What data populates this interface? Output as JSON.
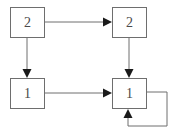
{
  "diagram": {
    "type": "directed-graph",
    "background_color": "#ffffff",
    "stroke_color": "#6e6e6e",
    "label_color": "#4a4a4a",
    "canvas": {
      "width": 178,
      "height": 133
    },
    "nodes": [
      {
        "id": "n-top-left",
        "label": "2",
        "x": 10,
        "y": 7,
        "width": 35,
        "height": 31
      },
      {
        "id": "n-top-right",
        "label": "2",
        "x": 112,
        "y": 7,
        "width": 35,
        "height": 31
      },
      {
        "id": "n-bottom-left",
        "label": "1",
        "x": 10,
        "y": 78,
        "width": 35,
        "height": 31
      },
      {
        "id": "n-bottom-right",
        "label": "1",
        "x": 112,
        "y": 78,
        "width": 35,
        "height": 31
      }
    ],
    "edges": [
      {
        "id": "edge-top-left-to-top-right",
        "from": "n-top-left",
        "to": "n-top-right",
        "direction": "right",
        "path": "M 45 22 L 107 22"
      },
      {
        "id": "edge-top-left-to-bottom-left",
        "from": "n-top-left",
        "to": "n-bottom-left",
        "direction": "down",
        "path": "M 27 38 L 27 73"
      },
      {
        "id": "edge-top-right-to-bottom-right",
        "from": "n-top-right",
        "to": "n-bottom-right",
        "direction": "down",
        "path": "M 129 38 L 129 73"
      },
      {
        "id": "edge-bottom-left-to-bottom-right",
        "from": "n-bottom-left",
        "to": "n-bottom-right",
        "direction": "right",
        "path": "M 45 93 L 107 93"
      },
      {
        "id": "edge-bottom-right-self-loop",
        "from": "n-bottom-right",
        "to": "n-bottom-right",
        "direction": "up",
        "path": "M 147 92 L 167 92 L 167 126 L 128 126 L 128 113"
      }
    ],
    "arrowheads": [
      {
        "id": "arrowhead-into-top-right",
        "edge": "edge-top-left-to-top-right",
        "tip_x": 112,
        "tip_y": 22,
        "points": "112,22 103,17.5 103,26.5"
      },
      {
        "id": "arrowhead-into-bottom-left",
        "edge": "edge-top-left-to-bottom-left",
        "tip_x": 27,
        "tip_y": 78,
        "points": "27,78 22.5,69 31.5,69"
      },
      {
        "id": "arrowhead-into-bottom-right-top",
        "edge": "edge-top-right-to-bottom-right",
        "tip_x": 129,
        "tip_y": 78,
        "points": "129,78 124.5,69 133.5,69"
      },
      {
        "id": "arrowhead-into-bottom-right-left",
        "edge": "edge-bottom-left-to-bottom-right",
        "tip_x": 112,
        "tip_y": 93,
        "points": "112,93 103,88.5 103,97.5"
      },
      {
        "id": "arrowhead-self-loop-into-bottom-right",
        "edge": "edge-bottom-right-self-loop",
        "tip_x": 128,
        "tip_y": 109,
        "points": "128,109 123.5,118 132.5,118"
      }
    ]
  }
}
